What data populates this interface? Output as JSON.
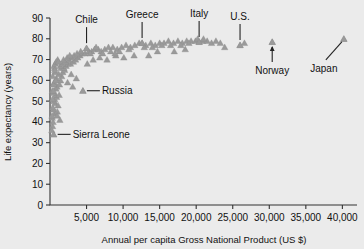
{
  "chart_data": {
    "type": "scatter",
    "title": "",
    "xlabel": "Annual per capita Gross National Product (US $)",
    "ylabel": "Life expectancy (years)",
    "xlim": [
      0,
      42000
    ],
    "ylim": [
      0,
      90
    ],
    "grid": false,
    "legend": "none",
    "marker": "triangle",
    "marker_color": "#9a9a9a",
    "background_color": "#ebebeb",
    "xticks": [
      0,
      5000,
      10000,
      15000,
      20000,
      25000,
      30000,
      35000,
      40000
    ],
    "xticklabels": [
      "",
      "5,000",
      "10,000",
      "15,000",
      "20,000",
      "25,000",
      "30,000",
      "35,000",
      "40,000"
    ],
    "yticks": [
      0,
      10,
      20,
      30,
      40,
      50,
      60,
      70,
      80,
      90
    ],
    "yticklabels": [
      "0",
      "10",
      "20",
      "30",
      "40",
      "50",
      "60",
      "70",
      "80",
      "90"
    ],
    "annotations": [
      {
        "label": "Chile",
        "point_x": 5000,
        "point_y": 75.5,
        "leader": "vertical-down"
      },
      {
        "label": "Greece",
        "point_x": 12600,
        "point_y": 78.0,
        "leader": "vertical-down"
      },
      {
        "label": "Italy",
        "point_x": 20400,
        "point_y": 78.5,
        "leader": "vertical-down"
      },
      {
        "label": "U.S.",
        "point_x": 26000,
        "point_y": 77.0,
        "leader": "vertical-down"
      },
      {
        "label": "Norway",
        "point_x": 30400,
        "point_y": 78.5,
        "leader": "vertical-up"
      },
      {
        "label": "Japan",
        "point_x": 40200,
        "point_y": 80.0,
        "leader": "diagonal-up-right"
      },
      {
        "label": "Russia",
        "point_x": 4500,
        "point_y": 55.0,
        "leader": "horizontal-left"
      },
      {
        "label": "Sierra Leone",
        "point_x": 500,
        "point_y": 34.0,
        "leader": "horizontal-left"
      }
    ],
    "points": [
      [
        350,
        38
      ],
      [
        420,
        40
      ],
      [
        300,
        42
      ],
      [
        500,
        34
      ],
      [
        600,
        44
      ],
      [
        480,
        46
      ],
      [
        380,
        47
      ],
      [
        700,
        49
      ],
      [
        520,
        50
      ],
      [
        640,
        51
      ],
      [
        900,
        52
      ],
      [
        760,
        53
      ],
      [
        430,
        54
      ],
      [
        310,
        55
      ],
      [
        820,
        56
      ],
      [
        1000,
        45
      ],
      [
        1100,
        48
      ],
      [
        1250,
        53
      ],
      [
        950,
        57
      ],
      [
        1300,
        58
      ],
      [
        560,
        59
      ],
      [
        1450,
        60
      ],
      [
        880,
        61
      ],
      [
        1600,
        62
      ],
      [
        1200,
        63
      ],
      [
        700,
        64
      ],
      [
        1750,
        64
      ],
      [
        2000,
        65
      ],
      [
        1500,
        66
      ],
      [
        1900,
        66
      ],
      [
        2200,
        67
      ],
      [
        1400,
        67
      ],
      [
        2450,
        68
      ],
      [
        1700,
        68
      ],
      [
        2800,
        68
      ],
      [
        2100,
        69
      ],
      [
        3200,
        69
      ],
      [
        2600,
        70
      ],
      [
        1850,
        70
      ],
      [
        3500,
        70
      ],
      [
        3000,
        71
      ],
      [
        2350,
        71
      ],
      [
        3800,
        71
      ],
      [
        4100,
        72
      ],
      [
        3300,
        72
      ],
      [
        2700,
        72
      ],
      [
        4400,
        73
      ],
      [
        3700,
        73
      ],
      [
        4800,
        73
      ],
      [
        5000,
        75.5
      ],
      [
        5300,
        74
      ],
      [
        4200,
        74
      ],
      [
        5700,
        74
      ],
      [
        6100,
        75
      ],
      [
        5500,
        73
      ],
      [
        6600,
        75
      ],
      [
        7000,
        74
      ],
      [
        6300,
        76
      ],
      [
        7500,
        75
      ],
      [
        8000,
        76
      ],
      [
        7200,
        73
      ],
      [
        8600,
        76
      ],
      [
        9200,
        75
      ],
      [
        8300,
        74
      ],
      [
        9800,
        76
      ],
      [
        10400,
        77
      ],
      [
        9500,
        74
      ],
      [
        11000,
        76
      ],
      [
        11600,
        77
      ],
      [
        10800,
        75
      ],
      [
        12200,
        78
      ],
      [
        12600,
        78
      ],
      [
        13100,
        77
      ],
      [
        12900,
        76
      ],
      [
        13800,
        78
      ],
      [
        14400,
        77
      ],
      [
        15000,
        78
      ],
      [
        14000,
        76
      ],
      [
        15600,
        78
      ],
      [
        16200,
        79
      ],
      [
        15300,
        77
      ],
      [
        16900,
        78
      ],
      [
        17500,
        79
      ],
      [
        16500,
        77
      ],
      [
        18100,
        78
      ],
      [
        18700,
        79
      ],
      [
        17900,
        77
      ],
      [
        19300,
        79
      ],
      [
        19900,
        79
      ],
      [
        19000,
        78
      ],
      [
        20400,
        78.5
      ],
      [
        20900,
        79
      ],
      [
        20200,
        80
      ],
      [
        21500,
        79
      ],
      [
        22100,
        78
      ],
      [
        21000,
        80
      ],
      [
        22700,
        79
      ],
      [
        23300,
        78
      ],
      [
        26000,
        77
      ],
      [
        26600,
        78
      ],
      [
        30400,
        78.5
      ],
      [
        40200,
        80
      ],
      [
        250,
        36
      ],
      [
        280,
        43
      ],
      [
        340,
        51
      ],
      [
        450,
        58
      ],
      [
        380,
        62
      ],
      [
        620,
        66
      ],
      [
        540,
        67
      ],
      [
        720,
        68
      ],
      [
        660,
        65
      ],
      [
        850,
        69
      ],
      [
        780,
        60
      ],
      [
        1050,
        70
      ],
      [
        1150,
        69
      ],
      [
        990,
        43
      ],
      [
        1350,
        41
      ],
      [
        460,
        55
      ],
      [
        4500,
        55
      ],
      [
        3100,
        57
      ],
      [
        2900,
        63
      ],
      [
        5900,
        70
      ],
      [
        7800,
        70
      ],
      [
        9000,
        72
      ],
      [
        10100,
        71
      ],
      [
        13500,
        72
      ],
      [
        17000,
        74
      ],
      [
        18500,
        75
      ],
      [
        23900,
        76
      ],
      [
        5100,
        68
      ],
      [
        6800,
        71
      ],
      [
        8900,
        73
      ],
      [
        11500,
        72
      ],
      [
        14700,
        74
      ],
      [
        2400,
        59
      ],
      [
        3600,
        61
      ]
    ]
  }
}
